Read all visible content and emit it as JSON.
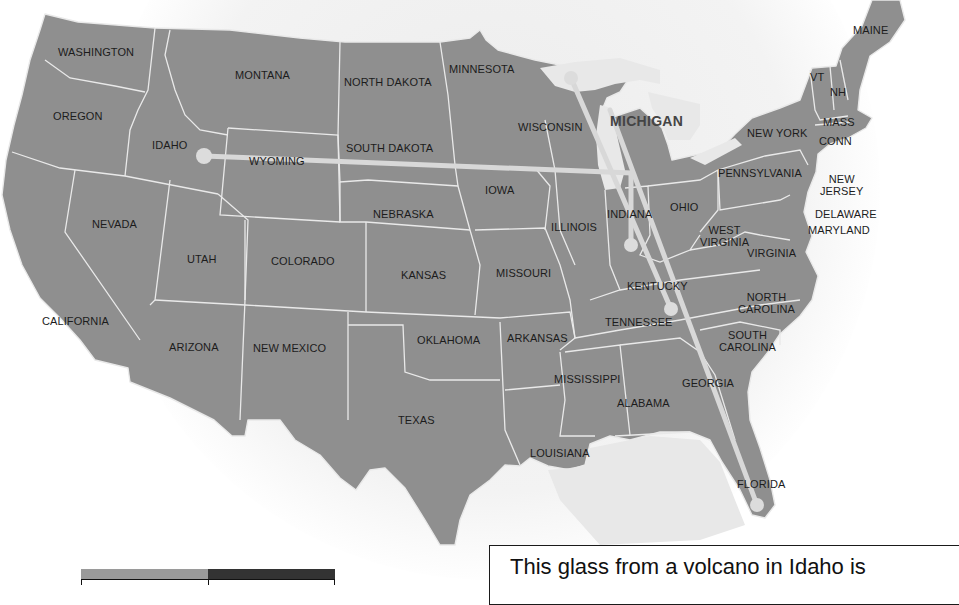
{
  "map": {
    "title_highlight": "MICHIGAN",
    "colors": {
      "land": "#8f8f8f",
      "border": "#e9e9e9",
      "path": "#d8d8d8",
      "water": "#e8e8e8"
    },
    "states": [
      {
        "id": "washington",
        "label": "WASHINGTON",
        "x": 58,
        "y": 46
      },
      {
        "id": "oregon",
        "label": "OREGON",
        "x": 53,
        "y": 110
      },
      {
        "id": "california",
        "label": "CALIFORNIA",
        "x": 42,
        "y": 315
      },
      {
        "id": "nevada",
        "label": "NEVADA",
        "x": 92,
        "y": 218
      },
      {
        "id": "idaho",
        "label": "IDAHO",
        "x": 152,
        "y": 139
      },
      {
        "id": "montana",
        "label": "MONTANA",
        "x": 235,
        "y": 69
      },
      {
        "id": "wyoming",
        "label": "WYOMING",
        "x": 249,
        "y": 155
      },
      {
        "id": "utah",
        "label": "UTAH",
        "x": 187,
        "y": 253
      },
      {
        "id": "colorado",
        "label": "COLORADO",
        "x": 271,
        "y": 255
      },
      {
        "id": "arizona",
        "label": "ARIZONA",
        "x": 169,
        "y": 341
      },
      {
        "id": "new-mexico",
        "label": "NEW MEXICO",
        "x": 253,
        "y": 342
      },
      {
        "id": "north-dakota",
        "label": "NORTH DAKOTA",
        "x": 344,
        "y": 76
      },
      {
        "id": "south-dakota",
        "label": "SOUTH DAKOTA",
        "x": 346,
        "y": 142
      },
      {
        "id": "nebraska",
        "label": "NEBRASKA",
        "x": 373,
        "y": 208
      },
      {
        "id": "kansas",
        "label": "KANSAS",
        "x": 401,
        "y": 269
      },
      {
        "id": "oklahoma",
        "label": "OKLAHOMA",
        "x": 417,
        "y": 334
      },
      {
        "id": "texas",
        "label": "TEXAS",
        "x": 398,
        "y": 414
      },
      {
        "id": "minnesota",
        "label": "MINNESOTA",
        "x": 449,
        "y": 63
      },
      {
        "id": "iowa",
        "label": "IOWA",
        "x": 485,
        "y": 184
      },
      {
        "id": "missouri",
        "label": "MISSOURI",
        "x": 496,
        "y": 267
      },
      {
        "id": "arkansas",
        "label": "ARKANSAS",
        "x": 507,
        "y": 332
      },
      {
        "id": "louisiana",
        "label": "LOUISIANA",
        "x": 530,
        "y": 447
      },
      {
        "id": "wisconsin",
        "label": "WISCONSIN",
        "x": 518,
        "y": 121
      },
      {
        "id": "illinois",
        "label": "ILLINOIS",
        "x": 551,
        "y": 221
      },
      {
        "id": "mississippi",
        "label": "MISSISSIPPI",
        "x": 554,
        "y": 373
      },
      {
        "id": "indiana",
        "label": "INDIANA",
        "x": 607,
        "y": 208
      },
      {
        "id": "kentucky",
        "label": "KENTUCKY",
        "x": 627,
        "y": 280
      },
      {
        "id": "tennessee",
        "label": "TENNESSEE",
        "x": 605,
        "y": 316
      },
      {
        "id": "alabama",
        "label": "ALABAMA",
        "x": 617,
        "y": 397
      },
      {
        "id": "georgia",
        "label": "GEORGIA",
        "x": 682,
        "y": 377
      },
      {
        "id": "florida",
        "label": "FLORIDA",
        "x": 737,
        "y": 478
      },
      {
        "id": "ohio",
        "label": "OHIO",
        "x": 670,
        "y": 201
      },
      {
        "id": "west-virginia",
        "label": "WEST\nVIRGINIA",
        "x": 700,
        "y": 224
      },
      {
        "id": "virginia",
        "label": "VIRGINIA",
        "x": 747,
        "y": 247
      },
      {
        "id": "north-carolina",
        "label": "NORTH\nCAROLINA",
        "x": 738,
        "y": 291
      },
      {
        "id": "south-carolina",
        "label": "SOUTH\nCAROLINA",
        "x": 719,
        "y": 329
      },
      {
        "id": "pennsylvania",
        "label": "PENNSYLVANIA",
        "x": 718,
        "y": 167
      },
      {
        "id": "new-york",
        "label": "NEW YORK",
        "x": 747,
        "y": 127
      },
      {
        "id": "new-jersey",
        "label": "NEW\nJERSEY",
        "x": 820,
        "y": 173
      },
      {
        "id": "delaware",
        "label": "DELAWARE",
        "x": 815,
        "y": 208
      },
      {
        "id": "maryland",
        "label": "MARYLAND",
        "x": 808,
        "y": 224
      },
      {
        "id": "vermont",
        "label": "VT",
        "x": 810,
        "y": 71
      },
      {
        "id": "new-hampshire",
        "label": "NH",
        "x": 830,
        "y": 86
      },
      {
        "id": "massachusetts",
        "label": "MASS",
        "x": 823,
        "y": 116
      },
      {
        "id": "connecticut",
        "label": "CONN",
        "x": 819,
        "y": 135
      },
      {
        "id": "maine",
        "label": "MAINE",
        "x": 853,
        "y": 24
      }
    ],
    "michigan_label": {
      "label": "MICHIGAN",
      "x": 610,
      "y": 115
    },
    "path_points": [
      {
        "name": "idaho-source",
        "x": 204,
        "y": 156
      },
      {
        "name": "michigan-upper",
        "x": 571,
        "y": 78
      },
      {
        "name": "indiana",
        "x": 631,
        "y": 245
      },
      {
        "name": "tennessee",
        "x": 671,
        "y": 309
      },
      {
        "name": "florida",
        "x": 757,
        "y": 505
      }
    ]
  },
  "legend": {
    "swatches": [
      {
        "name": "light",
        "color": "#9a9a9a"
      },
      {
        "name": "dark",
        "color": "#333333"
      }
    ]
  },
  "caption": {
    "text": "This glass from a volcano in Idaho is"
  }
}
